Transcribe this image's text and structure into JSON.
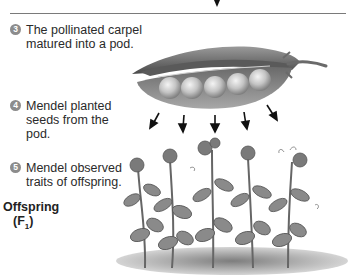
{
  "steps": [
    {
      "number": "3",
      "line1": "The pollinated carpel",
      "line2": "matured into a pod."
    },
    {
      "number": "4",
      "line1": "Mendel planted",
      "line2": "seeds from the",
      "line3": "pod."
    },
    {
      "number": "5",
      "line1": "Mendel observed",
      "line2": "traits of offspring."
    }
  ],
  "generation_label": {
    "line1": "Offspring",
    "line2_prefix": "(F",
    "line2_sub": "1",
    "line2_suffix": ")"
  },
  "illustration": {
    "pod": {
      "seed_count": 5,
      "icon": "pea-pod-icon"
    },
    "arrow_count": 5,
    "plant_count": 5
  },
  "colors": {
    "line": "#7a7a7a",
    "badge": "#8c8c8c",
    "text": "#2a2a2a"
  }
}
